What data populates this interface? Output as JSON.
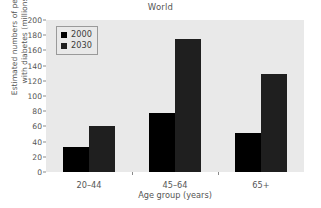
{
  "chart_data": {
    "type": "bar",
    "title": "World",
    "xlabel": "Age group (years)",
    "ylabel_line1": "Estimated numbers of people",
    "ylabel_line2": "with diabetes (millions)",
    "categories": [
      "20–44",
      "45–64",
      "65+"
    ],
    "series": [
      {
        "name": "2000",
        "color": "#000000",
        "values": [
          33,
          78,
          51
        ]
      },
      {
        "name": "2030",
        "color": "#1f1f1f",
        "values": [
          60,
          175,
          129
        ]
      }
    ],
    "ylim": [
      0,
      200
    ],
    "ytick_values": [
      0,
      20,
      40,
      60,
      80,
      100,
      120,
      140,
      160,
      180,
      200
    ],
    "ytick_labels": [
      "0",
      "20",
      "40",
      "60",
      "80",
      "100",
      "120",
      "140",
      "160",
      "180",
      "200"
    ],
    "grid": false,
    "legend_position": "top-left",
    "legend_entries": [
      "2000",
      "2030"
    ],
    "panel_background": "#e9e9e9",
    "page_background": "#ffffff"
  }
}
